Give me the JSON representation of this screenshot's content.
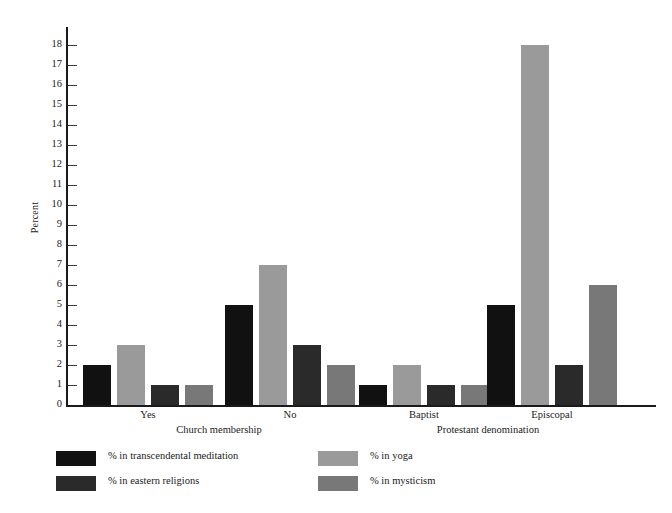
{
  "chart_data": {
    "type": "bar",
    "title": "",
    "subtitle": "",
    "xlabel": "",
    "ylabel": "Percent",
    "ylim": [
      0,
      18
    ],
    "ytick_labels": [
      "0",
      "1",
      "2",
      "3",
      "4",
      "5",
      "6",
      "7",
      "8",
      "9",
      "10",
      "11",
      "12",
      "13",
      "14",
      "15",
      "16",
      "17",
      "18"
    ],
    "grid": false,
    "legend_position": "bottom",
    "categories": [
      "Yes",
      "No",
      "Baptist",
      "Episcopal"
    ],
    "category_groups": [
      {
        "label": "Church membership",
        "categories": [
          "Yes",
          "No"
        ]
      },
      {
        "label": "Protestant denomination",
        "categories": [
          "Baptist",
          "Episcopal"
        ]
      }
    ],
    "series": [
      {
        "name": "% in transcendental meditation",
        "color": "#111111",
        "values": [
          2,
          5,
          1,
          5
        ]
      },
      {
        "name": "% in yoga",
        "color": "#9a9a9a",
        "values": [
          3,
          7,
          2,
          18
        ]
      },
      {
        "name": "% in eastern religions",
        "color": "#2a2a2a",
        "values": [
          1,
          3,
          1,
          2
        ]
      },
      {
        "name": "% in mysticism",
        "color": "#787878",
        "values": [
          1,
          2,
          1,
          6
        ]
      }
    ]
  },
  "axis": {
    "y_label": "Percent"
  },
  "legend": {
    "items": [
      {
        "label": "% in transcendental meditation",
        "color": "#111111"
      },
      {
        "label": "% in yoga",
        "color": "#9a9a9a"
      },
      {
        "label": "% in eastern religions",
        "color": "#2a2a2a"
      },
      {
        "label": "% in mysticism",
        "color": "#787878"
      }
    ]
  },
  "footer": {
    "source": ""
  }
}
